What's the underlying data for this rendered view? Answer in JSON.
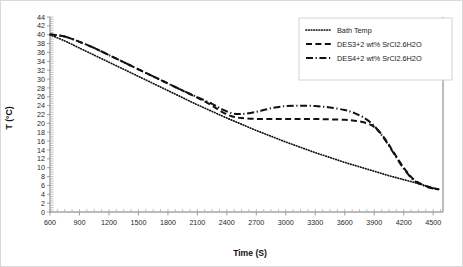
{
  "chart_data": {
    "type": "line",
    "title": "",
    "xlabel": "Time (S)",
    "ylabel": "T (°C)",
    "xlim": [
      600,
      4600
    ],
    "ylim": [
      0,
      44
    ],
    "xticks": [
      600,
      900,
      1200,
      1500,
      1800,
      2100,
      2400,
      2700,
      3000,
      3300,
      3600,
      3900,
      4200,
      4500
    ],
    "yticks": [
      0,
      2,
      4,
      6,
      8,
      10,
      12,
      14,
      16,
      18,
      20,
      22,
      24,
      26,
      28,
      30,
      32,
      34,
      36,
      38,
      40,
      42,
      44
    ],
    "grid": false,
    "legend_position": "top-right",
    "series": [
      {
        "name": "Bath Temp",
        "style": "dotted",
        "color": "#111111",
        "x": [
          600,
          750,
          900,
          1050,
          1200,
          1350,
          1500,
          1650,
          1800,
          1950,
          2100,
          2250,
          2400,
          2550,
          2700,
          2850,
          3000,
          3150,
          3300,
          3450,
          3600,
          3750,
          3900,
          4050,
          4200,
          4350,
          4500,
          4560
        ],
        "y": [
          40.0,
          38.6,
          37.0,
          35.4,
          33.8,
          32.2,
          30.6,
          29.0,
          27.4,
          25.8,
          24.2,
          22.7,
          21.2,
          19.8,
          18.4,
          17.1,
          15.8,
          14.6,
          13.4,
          12.3,
          11.2,
          10.2,
          9.2,
          8.2,
          7.3,
          6.4,
          5.4,
          5.1
        ]
      },
      {
        "name": "DES3+2 wt% SrCl2.6H2O",
        "style": "dashed",
        "color": "#111111",
        "x": [
          600,
          750,
          900,
          1050,
          1200,
          1350,
          1500,
          1650,
          1800,
          1950,
          2100,
          2250,
          2350,
          2450,
          2550,
          2700,
          2850,
          3000,
          3150,
          3300,
          3450,
          3600,
          3700,
          3800,
          3900,
          4000,
          4100,
          4200,
          4300,
          4400,
          4500,
          4560
        ],
        "y": [
          40.1,
          39.6,
          38.4,
          37.0,
          35.4,
          33.8,
          32.2,
          30.6,
          29.0,
          27.4,
          25.8,
          24.0,
          22.6,
          21.6,
          21.2,
          21.0,
          21.0,
          21.0,
          21.0,
          21.0,
          20.9,
          20.8,
          20.6,
          20.2,
          19.2,
          16.8,
          13.4,
          10.0,
          7.4,
          6.1,
          5.4,
          5.1
        ]
      },
      {
        "name": "DES4+2 wt% SrCl2.6H2O",
        "style": "dashdot",
        "color": "#111111",
        "x": [
          600,
          750,
          900,
          1050,
          1200,
          1350,
          1500,
          1650,
          1800,
          1950,
          2100,
          2250,
          2350,
          2450,
          2550,
          2700,
          2850,
          3000,
          3150,
          3300,
          3450,
          3600,
          3700,
          3800,
          3900,
          4000,
          4100,
          4200,
          4300,
          4400,
          4500,
          4560
        ],
        "y": [
          40.1,
          39.6,
          38.4,
          37.0,
          35.4,
          33.8,
          32.2,
          30.6,
          29.0,
          27.4,
          25.9,
          24.4,
          23.2,
          22.3,
          22.1,
          22.6,
          23.4,
          23.9,
          24.0,
          23.9,
          23.6,
          23.0,
          22.3,
          21.2,
          19.4,
          16.6,
          13.2,
          9.8,
          7.2,
          6.0,
          5.3,
          5.1
        ]
      }
    ]
  },
  "legend": {
    "items": [
      {
        "label": "Bath Temp"
      },
      {
        "label": "DES3+2 wt% SrCl2.6H2O"
      },
      {
        "label": "DES4+2 wt% SrCl2.6H2O"
      }
    ]
  }
}
